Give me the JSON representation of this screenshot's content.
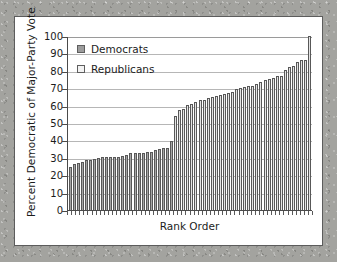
{
  "chart_data": {
    "type": "bar",
    "title": "",
    "xlabel": "Rank Order",
    "ylabel": "Percent Democratic of Major-Party Vote",
    "ylim": [
      0,
      100
    ],
    "yticks": [
      0,
      10,
      20,
      30,
      40,
      50,
      60,
      70,
      80,
      90,
      100
    ],
    "xticklabels": [],
    "grid": "horizontal",
    "legend_position": "top-left",
    "legend": [
      {
        "name": "Democrats",
        "swatch": "dem",
        "color": "#9d9d9d"
      },
      {
        "name": "Republicans",
        "swatch": "rep",
        "color": "#f2f2f2"
      }
    ],
    "categories": [
      "1",
      "2",
      "3",
      "4",
      "5",
      "6",
      "7",
      "8",
      "9",
      "10",
      "11",
      "12",
      "13",
      "14",
      "15",
      "16",
      "17",
      "18",
      "19",
      "20",
      "21",
      "22",
      "23",
      "24",
      "25",
      "26",
      "27",
      "28",
      "29",
      "30",
      "31",
      "32",
      "33",
      "34",
      "35",
      "36",
      "37",
      "38",
      "39",
      "40",
      "41",
      "42",
      "43",
      "44",
      "45",
      "46",
      "47",
      "48",
      "49",
      "50",
      "51",
      "52",
      "53",
      "54",
      "55",
      "56",
      "57",
      "58",
      "59",
      "60"
    ],
    "values": [
      24.5,
      26.5,
      27.0,
      27.5,
      28.5,
      29.0,
      29.5,
      30.0,
      30.2,
      30.3,
      30.4,
      30.5,
      30.6,
      31.0,
      31.5,
      32.5,
      32.8,
      33.0,
      33.0,
      33.2,
      33.3,
      34.5,
      35.0,
      35.5,
      35.8,
      39.5,
      54.0,
      57.5,
      58.0,
      60.5,
      61.0,
      62.0,
      63.0,
      63.5,
      64.5,
      65.0,
      65.5,
      66.0,
      66.5,
      67.0,
      68.0,
      69.5,
      70.0,
      70.5,
      71.0,
      71.5,
      72.5,
      73.5,
      74.5,
      75.5,
      76.0,
      77.0,
      77.2,
      80.5,
      82.0,
      83.0,
      85.0,
      86.0,
      86.5,
      100.0
    ],
    "series_assignment": [
      "dem",
      "dem",
      "dem",
      "dem",
      "dem",
      "dem",
      "dem",
      "dem",
      "dem",
      "dem",
      "dem",
      "dem",
      "dem",
      "dem",
      "dem",
      "dem",
      "dem",
      "dem",
      "dem",
      "dem",
      "dem",
      "dem",
      "dem",
      "dem",
      "dem",
      "dem",
      "rep",
      "rep",
      "rep",
      "rep",
      "rep",
      "rep",
      "rep",
      "rep",
      "rep",
      "rep",
      "rep",
      "rep",
      "rep",
      "rep",
      "rep",
      "rep",
      "rep",
      "rep",
      "rep",
      "rep",
      "rep",
      "rep",
      "rep",
      "rep",
      "rep",
      "rep",
      "rep",
      "rep",
      "rep",
      "rep",
      "rep",
      "rep",
      "rep",
      "rep"
    ]
  }
}
